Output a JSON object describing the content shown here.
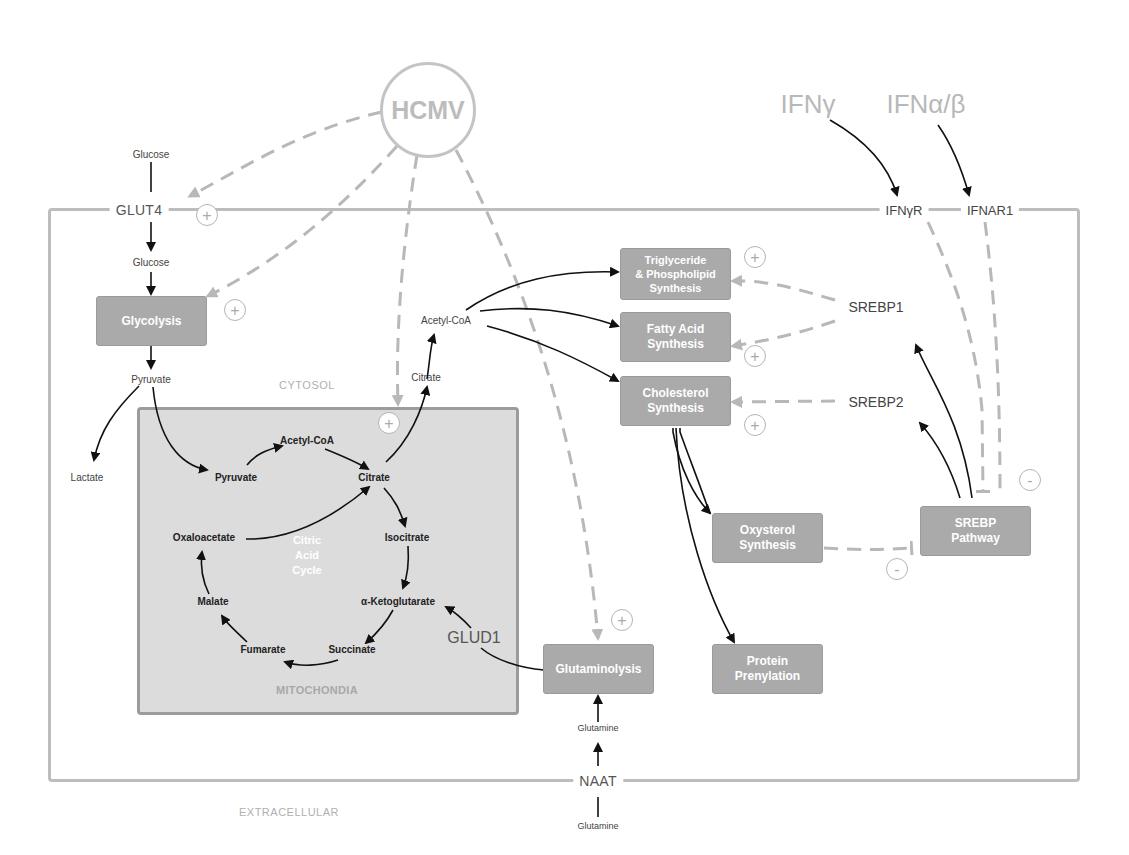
{
  "virus": {
    "label": "HCMV"
  },
  "cytokines": {
    "ifn_gamma": "IFNγ",
    "ifn_alpha_beta": "IFNα/β"
  },
  "receptors": {
    "glut4": "GLUT4",
    "ifngr": "IFNγR",
    "ifnar1": "IFNAR1",
    "naat": "NAAT"
  },
  "compartments": {
    "cytosol": "CYTOSOL",
    "mitochondria": "MITOCHONDIA",
    "extracellular": "EXTRACELLULAR"
  },
  "metabolites": {
    "glucose_ext": "Glucose",
    "glucose_int": "Glucose",
    "pyruvate_cyto": "Pyruvate",
    "lactate": "Lactate",
    "citrate_cyto": "Citrate",
    "acetylcoa_cyto": "Acetyl-CoA",
    "glutamine_int": "Glutamine",
    "glutamine_ext": "Glutamine"
  },
  "tca_cycle": {
    "title_line1": "Citric",
    "title_line2": "Acid",
    "title_line3": "Cycle",
    "pyruvate": "Pyruvate",
    "acetylcoa": "Acetyl-CoA",
    "citrate": "Citrate",
    "isocitrate": "Isocitrate",
    "akg": "α-Ketoglutarate",
    "succinate": "Succinate",
    "fumarate": "Fumarate",
    "malate": "Malate",
    "oxaloacetate": "Oxaloacetate"
  },
  "enzymes": {
    "glud1": "GLUD1",
    "srebp1": "SREBP1",
    "srebp2": "SREBP2"
  },
  "process_boxes": {
    "glycolysis": "Glycolysis",
    "tg_line1": "Triglyceride",
    "tg_line2": "& Phospholipid",
    "tg_line3": "Synthesis",
    "fa_line1": "Fatty Acid",
    "fa_line2": "Synthesis",
    "chol_line1": "Cholesterol",
    "chol_line2": "Synthesis",
    "oxy_line1": "Oxysterol",
    "oxy_line2": "Synthesis",
    "srebp_line1": "SREBP",
    "srebp_line2": "Pathway",
    "glutaminolysis": "Glutaminolysis",
    "prenyl_line1": "Protein",
    "prenyl_line2": "Prenylation"
  },
  "signs": {
    "plus": "+",
    "minus": "-"
  },
  "colors": {
    "box_fill": "#aaaaaa",
    "mito_fill": "#dcdcdc",
    "dashed_arrow": "#b8b8b8",
    "solid_arrow": "#111111"
  }
}
